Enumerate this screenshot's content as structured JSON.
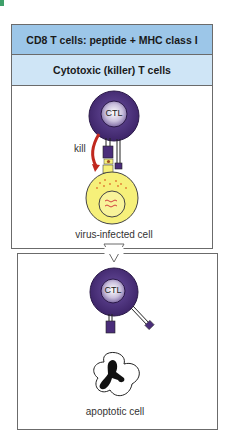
{
  "figure": {
    "header": "CD8 T cells: peptide + MHC class I",
    "subheader": "Cytotoxic (killer) T cells",
    "top_panel": {
      "cell_label": "CTL",
      "action_label": "kill",
      "target_label": "virus-infected cell"
    },
    "bottom_panel": {
      "cell_label": "CTL",
      "result_label": "apoptotic cell"
    },
    "colors": {
      "header_bg": "#9cc6e8",
      "subheader_bg": "#cfe5f6",
      "ctl_purple": "#4a2d7a",
      "infected_yellow": "#f6f07a",
      "kill_arrow": "#c0281e"
    }
  }
}
